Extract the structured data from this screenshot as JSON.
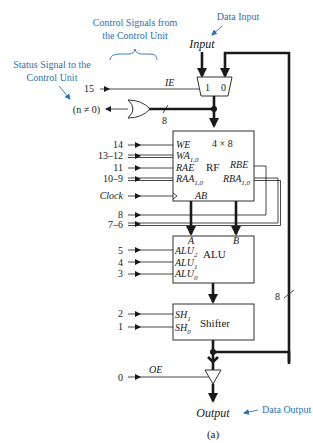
{
  "annotations": {
    "control_signals": [
      "Control Signals from",
      "the Control Unit"
    ],
    "status_signal": [
      "Status Signal to the",
      "Control Unit"
    ],
    "data_input": "Data Input",
    "data_output": "Data Output"
  },
  "io": {
    "input": "Input",
    "output": "Output",
    "status": "(n ≠ 0)",
    "caption": "(a)"
  },
  "mux": {
    "in1": "1",
    "in0": "0",
    "select": "IE",
    "select_bit": "15"
  },
  "bus_width_labels": {
    "or_bus": "8",
    "feedback_bus": "8"
  },
  "rf": {
    "name": "RF",
    "size": "4 × 8",
    "inputs": [
      {
        "bit": "14",
        "label": "WE",
        "sub": ""
      },
      {
        "bit": "13–12",
        "label": "WA",
        "sub": "1,0"
      },
      {
        "bit": "11",
        "label": "RAE",
        "sub": ""
      },
      {
        "bit": "10–9",
        "label": "RAA",
        "sub": "1,0"
      },
      {
        "bit": "Clock",
        "label": "",
        "sub": ""
      }
    ],
    "outputs": [
      {
        "label": "RBE",
        "sub": "",
        "bit": "8"
      },
      {
        "label": "RBA",
        "sub": "1,0",
        "bit": "7–6"
      }
    ],
    "port_a": "A",
    "port_b": "B"
  },
  "alu": {
    "name": "ALU",
    "port_a": "A",
    "port_b": "B",
    "inputs": [
      {
        "bit": "5",
        "label": "ALU",
        "sub": "2"
      },
      {
        "bit": "4",
        "label": "ALU",
        "sub": "1"
      },
      {
        "bit": "3",
        "label": "ALU",
        "sub": "0"
      }
    ]
  },
  "shifter": {
    "name": "Shifter",
    "inputs": [
      {
        "bit": "2",
        "label": "SH",
        "sub": "1"
      },
      {
        "bit": "1",
        "label": "SH",
        "sub": "0"
      }
    ]
  },
  "output_enable": {
    "label": "OE",
    "bit": "0"
  }
}
